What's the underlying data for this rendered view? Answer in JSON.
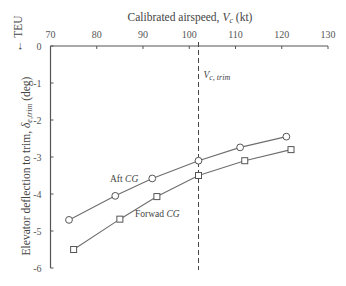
{
  "chart_data": {
    "type": "line",
    "title": "",
    "xlabel": "Calibrated airspeed, V_c (kt)",
    "xlabel_parts": {
      "prefix": "Calibrated airspeed, ",
      "var": "V",
      "sub": "c",
      "suffix": " (kt)"
    },
    "ylabel": "Elevator deflection to trim, δ_e,trim (deg)",
    "ylabel_parts": {
      "prefix": "Elevator deflection to trim, ",
      "var": "δ",
      "sub": "e,trim",
      "suffix": " (deg)"
    },
    "x_axis_position": "top",
    "xlim": [
      70,
      130
    ],
    "ylim": [
      -6,
      0
    ],
    "xticks": [
      70,
      80,
      90,
      100,
      110,
      120,
      130
    ],
    "yticks": [
      0,
      -1,
      -2,
      -3,
      -4,
      -5,
      -6
    ],
    "grid": false,
    "annotations": [
      {
        "type": "vertical-dashed-line",
        "x": 102,
        "label": "V_c,trim",
        "label_var": "V",
        "label_sub": "c, trim"
      },
      {
        "type": "axis-note",
        "text": "← TEU",
        "position": "top-left, rotated"
      }
    ],
    "series": [
      {
        "name": "Aft CG",
        "label_prefix": "Aft ",
        "label_var": "CG",
        "marker": "circle",
        "x": [
          74,
          84,
          92,
          102,
          111,
          121
        ],
        "values": [
          -4.7,
          -4.05,
          -3.58,
          -3.1,
          -2.74,
          -2.45
        ]
      },
      {
        "name": "Forwad CG",
        "label_prefix": "Forwad ",
        "label_var": "CG",
        "marker": "square",
        "x": [
          75,
          85,
          93,
          102,
          112,
          122
        ],
        "values": [
          -5.5,
          -4.68,
          -4.07,
          -3.5,
          -3.1,
          -2.8
        ]
      }
    ],
    "legend": "inline labels next to curves"
  },
  "colors": {
    "line": "#6e6e6e",
    "axis": "#555555",
    "text": "#444444",
    "background": "#ffffff"
  }
}
